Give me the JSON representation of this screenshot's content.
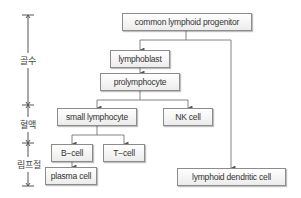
{
  "diagram": {
    "stages": [
      {
        "label": "골수",
        "meaning": "bone marrow"
      },
      {
        "label": "혈액",
        "meaning": "blood"
      },
      {
        "label": "림프절",
        "meaning": "lymph node"
      }
    ],
    "nodes": {
      "clp": "common lymphoid progenitor",
      "lymphoblast": "lymphoblast",
      "prolymphocyte": "prolymphocyte",
      "small_lymphocyte": "small lymphocyte",
      "nk_cell": "NK cell",
      "b_cell": "B−cell",
      "t_cell": "T−cell",
      "plasma_cell": "plasma cell",
      "dendritic": "lymphoid dendritic cell"
    },
    "edges": [
      [
        "common lymphoid progenitor",
        "lymphoblast"
      ],
      [
        "common lymphoid progenitor",
        "lymphoid dendritic cell"
      ],
      [
        "lymphoblast",
        "prolymphocyte"
      ],
      [
        "prolymphocyte",
        "small lymphocyte"
      ],
      [
        "prolymphocyte",
        "NK cell"
      ],
      [
        "small lymphocyte",
        "B-cell"
      ],
      [
        "small lymphocyte",
        "T-cell"
      ],
      [
        "B-cell",
        "plasma cell"
      ]
    ],
    "colors": {
      "line": "#666666",
      "border": "#8c8c8c",
      "text": "#333333"
    }
  }
}
